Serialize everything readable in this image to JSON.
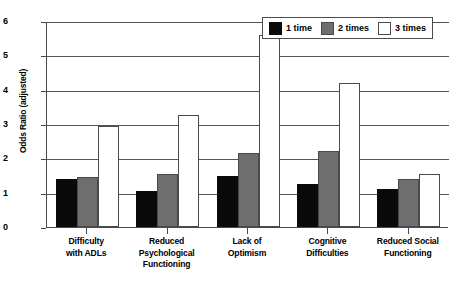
{
  "chart_data": {
    "type": "bar",
    "title": "",
    "xlabel": "",
    "ylabel": "Odds Ratio (adjusted)",
    "ylim": [
      0,
      6
    ],
    "yticks": [
      "0",
      "1",
      "2",
      "3",
      "4",
      "5",
      "6"
    ],
    "grid": true,
    "legend_position": "top-right",
    "categories": [
      "Difficulty\nwith ADLs",
      "Reduced\nPsychological\nFunctioning",
      "Lack of\nOptimism",
      "Cognitive\nDifficulties",
      "Reduced Social\nFunctioning"
    ],
    "category_lines": [
      [
        "Difficulty",
        "with ADLs"
      ],
      [
        "Reduced",
        "Psychological",
        "Functioning"
      ],
      [
        "Lack of",
        "Optimism"
      ],
      [
        "Cognitive",
        "Difficulties"
      ],
      [
        "Reduced Social",
        "Functioning"
      ]
    ],
    "series": [
      {
        "name": "1 time",
        "color": "#0a0a0a",
        "values": [
          1.4,
          1.05,
          1.5,
          1.25,
          1.1
        ]
      },
      {
        "name": "2 times",
        "color": "#6e6e6e",
        "values": [
          1.45,
          1.55,
          2.15,
          2.2,
          1.4
        ]
      },
      {
        "name": "3 times",
        "color": "#ffffff",
        "values": [
          2.95,
          3.25,
          5.6,
          4.2,
          1.55
        ]
      }
    ]
  },
  "legend": {
    "items": [
      {
        "label": "1 time",
        "swatch": "black-swatch"
      },
      {
        "label": "2 times",
        "swatch": "gray-swatch"
      },
      {
        "label": "3 times",
        "swatch": "white-swatch"
      }
    ]
  },
  "axes": {
    "y_title": "Odds Ratio (adjusted)"
  }
}
